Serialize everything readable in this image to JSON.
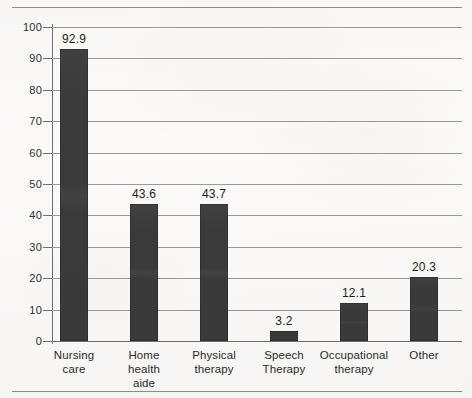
{
  "chart_data": {
    "type": "bar",
    "title": "",
    "subtitle": "",
    "xlabel": "",
    "ylabel": "",
    "ylim": [
      0,
      100
    ],
    "yticks": [
      0,
      10,
      20,
      30,
      40,
      50,
      60,
      70,
      80,
      90,
      100
    ],
    "ytick_labels": [
      "0",
      "10",
      "20",
      "30",
      "40",
      "50",
      "60",
      "70",
      "80",
      "90",
      "100"
    ],
    "grid": true,
    "legend": false,
    "legend_position": "none",
    "bar_color": "#3a3a3a",
    "categories": [
      "Nursing\ncare",
      "Home\nhealth\naide",
      "Physical\ntherapy",
      "Speech\nTherapy",
      "Occupational\ntherapy",
      "Other"
    ],
    "values": [
      92.9,
      43.6,
      43.7,
      3.2,
      12.1,
      20.3
    ],
    "value_labels": [
      "92.9",
      "43.6",
      "43.7",
      "3.2",
      "12.1",
      "20.3"
    ]
  }
}
